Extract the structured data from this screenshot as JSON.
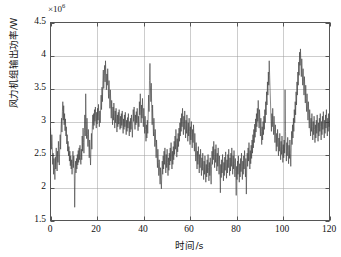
{
  "figure": {
    "exponent_prefix": "×10",
    "exponent_power": "6",
    "x_axis_label": "时间/s",
    "y_axis_label": "风力机组输出功率/W",
    "x_ticks": [
      "0",
      "20",
      "40",
      "60",
      "80",
      "100",
      "120"
    ],
    "y_ticks": [
      "4.5",
      "4",
      "3.5",
      "3",
      "2.5",
      "2",
      "1.5"
    ],
    "line_color": "#3a3a3a",
    "grid_color": "#9a9a9a",
    "axis_color": "#555555",
    "background_color": "#ffffff"
  },
  "chart_data": {
    "type": "line",
    "title": "",
    "xlabel": "时间/s",
    "ylabel": "风力机组输出功率/W",
    "y_exponent": 1000000,
    "y_exponent_label": "×10^6",
    "xlim": [
      0,
      120
    ],
    "ylim": [
      1.5,
      4.5
    ],
    "xticks": [
      0,
      20,
      40,
      60,
      80,
      100,
      120
    ],
    "yticks": [
      1.5,
      2,
      2.5,
      3,
      3.5,
      4,
      4.5
    ],
    "grid": true,
    "legend": null,
    "series": [
      {
        "name": "wind turbine output power",
        "units": "W",
        "x_start": 0,
        "x_step": 0.25,
        "values_scale": 1000000,
        "values": [
          2.9,
          2.72,
          2.58,
          2.8,
          2.62,
          2.35,
          2.52,
          2.2,
          2.44,
          2.3,
          2.12,
          2.46,
          2.28,
          2.6,
          2.4,
          2.25,
          2.55,
          2.38,
          2.7,
          2.48,
          2.34,
          2.62,
          2.8,
          2.58,
          2.9,
          3.05,
          2.84,
          3.15,
          3.3,
          3.02,
          3.24,
          2.95,
          3.12,
          2.86,
          3.04,
          2.78,
          2.92,
          2.66,
          2.8,
          2.55,
          2.7,
          2.48,
          2.62,
          2.4,
          2.55,
          2.33,
          2.48,
          2.28,
          2.42,
          2.2,
          2.36,
          2.55,
          2.3,
          2.48,
          2.26,
          1.7,
          2.18,
          2.4,
          2.22,
          2.44,
          2.28,
          2.5,
          2.34,
          2.56,
          2.38,
          2.6,
          2.42,
          2.64,
          2.45,
          2.35,
          2.58,
          2.42,
          2.78,
          2.55,
          2.9,
          2.68,
          2.52,
          2.86,
          3.1,
          2.78,
          3.42,
          3.0,
          2.74,
          3.05,
          2.8,
          2.62,
          2.88,
          2.66,
          2.45,
          2.72,
          2.5,
          2.34,
          2.6,
          2.82,
          2.58,
          2.92,
          3.1,
          2.88,
          3.12,
          2.94,
          3.18,
          3.0,
          3.22,
          3.05,
          2.9,
          3.14,
          2.96,
          3.2,
          3.02,
          3.26,
          3.08,
          2.92,
          3.16,
          2.98,
          3.22,
          3.4,
          3.18,
          3.52,
          3.3,
          3.62,
          3.78,
          3.5,
          3.7,
          3.85,
          3.6,
          3.92,
          3.68,
          3.48,
          3.72,
          3.55,
          3.8,
          3.58,
          3.35,
          3.62,
          3.42,
          3.2,
          3.48,
          3.28,
          3.05,
          3.32,
          3.12,
          2.95,
          3.22,
          3.02,
          3.28,
          3.08,
          2.9,
          3.16,
          2.98,
          3.2,
          3.0,
          2.84,
          3.1,
          2.92,
          3.14,
          2.96,
          3.18,
          3.0,
          2.88,
          3.08,
          2.9,
          3.12,
          2.94,
          3.16,
          2.98,
          2.82,
          3.04,
          2.88,
          3.1,
          2.92,
          3.14,
          2.96,
          2.8,
          3.02,
          2.85,
          3.06,
          2.9,
          3.12,
          2.94,
          2.78,
          3.0,
          2.84,
          3.05,
          2.88,
          3.1,
          2.92,
          2.76,
          2.98,
          3.18,
          3.0,
          3.22,
          3.04,
          2.88,
          3.1,
          2.95,
          3.15,
          2.98,
          3.2,
          3.02,
          2.86,
          3.08,
          2.92,
          3.3,
          3.1,
          3.42,
          3.18,
          2.98,
          3.25,
          3.05,
          3.35,
          3.12,
          2.92,
          3.2,
          3.0,
          2.82,
          3.08,
          2.88,
          2.7,
          2.95,
          2.75,
          3.02,
          2.82,
          3.1,
          3.4,
          3.15,
          3.62,
          3.88,
          3.55,
          3.3,
          3.58,
          3.2,
          2.95,
          3.25,
          3.0,
          2.78,
          3.05,
          2.85,
          2.62,
          2.88,
          2.68,
          2.45,
          2.72,
          2.52,
          2.3,
          2.58,
          2.38,
          2.18,
          2.42,
          2.25,
          2.05,
          2.3,
          2.12,
          1.98,
          2.22,
          2.4,
          2.2,
          2.48,
          2.28,
          2.55,
          2.35,
          2.6,
          2.42,
          2.22,
          2.5,
          2.3,
          2.58,
          2.38,
          2.18,
          2.45,
          2.26,
          2.52,
          2.34,
          2.6,
          2.4,
          2.68,
          2.48,
          2.28,
          2.55,
          2.35,
          2.62,
          2.42,
          2.7,
          2.5,
          2.78,
          2.58,
          2.88,
          2.66,
          2.46,
          2.74,
          2.54,
          2.82,
          2.62,
          2.9,
          2.7,
          2.98,
          2.78,
          3.05,
          2.85,
          3.12,
          2.92,
          3.2,
          3.0,
          2.8,
          3.08,
          2.88,
          3.16,
          2.95,
          2.75,
          3.02,
          2.82,
          3.1,
          2.9,
          2.7,
          2.98,
          2.78,
          3.05,
          2.85,
          2.65,
          2.92,
          2.72,
          3.0,
          2.8,
          2.6,
          2.88,
          2.68,
          2.95,
          2.75,
          2.55,
          2.82,
          2.62,
          2.4,
          2.68,
          2.48,
          2.28,
          2.55,
          2.35,
          2.62,
          2.42,
          2.22,
          2.5,
          2.3,
          2.58,
          2.38,
          2.18,
          2.45,
          2.26,
          2.52,
          2.32,
          2.12,
          2.4,
          2.2,
          2.48,
          2.28,
          2.08,
          2.35,
          2.16,
          2.42,
          2.22,
          2.5,
          2.3,
          2.1,
          2.38,
          2.18,
          2.45,
          2.25,
          2.05,
          2.32,
          2.55,
          2.35,
          2.62,
          2.42,
          2.7,
          2.5,
          2.3,
          2.58,
          2.38,
          2.65,
          2.45,
          2.25,
          2.52,
          2.32,
          2.6,
          2.4,
          2.2,
          2.48,
          2.28,
          1.92,
          2.35,
          2.15,
          2.42,
          2.22,
          2.5,
          2.3,
          2.1,
          2.38,
          2.18,
          2.46,
          2.26,
          2.54,
          2.34,
          2.14,
          2.42,
          2.22,
          2.5,
          2.3,
          2.58,
          2.38,
          2.18,
          2.45,
          2.25,
          2.52,
          2.32,
          2.6,
          2.4,
          2.2,
          2.48,
          2.28,
          2.56,
          2.36,
          2.16,
          2.44,
          2.24,
          1.88,
          2.32,
          2.12,
          2.4,
          2.2,
          2.48,
          2.28,
          2.08,
          2.36,
          2.16,
          2.44,
          2.24,
          2.52,
          2.32,
          2.12,
          2.4,
          2.2,
          2.48,
          2.28,
          2.56,
          2.36,
          2.16,
          2.44,
          1.9,
          2.3,
          2.52,
          2.32,
          2.6,
          2.4,
          2.68,
          2.48,
          2.28,
          2.56,
          2.36,
          2.64,
          2.44,
          2.72,
          2.52,
          2.8,
          2.6,
          2.88,
          2.68,
          2.96,
          2.76,
          3.04,
          2.84,
          3.12,
          2.92,
          3.2,
          3.0,
          3.32,
          3.1,
          2.9,
          3.18,
          2.98,
          2.78,
          3.05,
          2.85,
          2.65,
          2.92,
          2.72,
          3.0,
          2.8,
          3.08,
          2.88,
          3.18,
          2.98,
          3.3,
          3.1,
          3.45,
          3.25,
          3.6,
          3.4,
          3.75,
          3.55,
          3.92,
          3.7,
          3.48,
          3.28,
          3.05,
          2.85,
          3.12,
          2.92,
          3.2,
          3.0,
          2.8,
          3.08,
          2.88,
          2.68,
          2.95,
          2.75,
          2.55,
          2.82,
          2.62,
          2.88,
          2.68,
          2.48,
          2.75,
          2.55,
          2.82,
          2.62,
          2.42,
          2.7,
          2.5,
          2.78,
          2.58,
          2.38,
          2.65,
          2.45,
          2.72,
          2.52,
          3.48,
          2.85,
          2.6,
          2.4,
          2.68,
          2.48,
          2.76,
          2.56,
          2.36,
          2.64,
          2.44,
          2.72,
          2.52,
          2.32,
          2.6,
          2.85,
          2.65,
          2.95,
          2.75,
          3.05,
          2.85,
          3.18,
          2.98,
          3.3,
          3.1,
          3.45,
          3.25,
          3.6,
          3.4,
          3.75,
          3.55,
          3.9,
          3.7,
          4.05,
          3.85,
          4.1,
          3.88,
          3.68,
          3.95,
          3.75,
          3.55,
          3.8,
          3.6,
          3.4,
          3.68,
          3.48,
          3.28,
          3.55,
          3.35,
          3.15,
          3.42,
          3.22,
          3.02,
          3.3,
          3.1,
          2.9,
          3.18,
          2.98,
          2.78,
          3.05,
          2.85,
          3.12,
          2.92,
          2.72,
          3.0,
          2.8,
          3.08,
          2.88,
          2.68,
          2.95,
          2.75,
          3.02,
          2.82,
          3.1,
          2.9,
          2.7,
          2.98,
          2.78,
          3.05,
          2.85,
          3.12,
          2.92,
          2.72,
          3.0,
          2.8,
          3.08,
          2.88,
          3.15,
          2.95,
          2.75,
          3.02,
          2.82,
          3.1,
          2.9,
          3.18,
          2.98,
          2.78,
          3.05,
          2.85,
          3.12,
          2.92,
          3.0
        ]
      }
    ]
  }
}
